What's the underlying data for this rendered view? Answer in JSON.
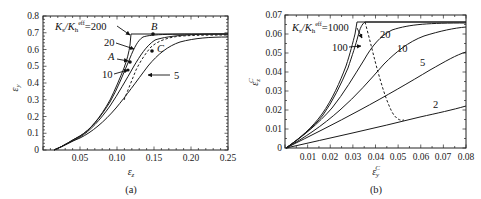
{
  "chart_data": [
    {
      "panel": "(a)",
      "type": "line",
      "title": "",
      "xlabel": "ε_z",
      "ylabel": "ε_y",
      "xlim": [
        0,
        0.25
      ],
      "ylim": [
        0,
        0.8
      ],
      "xticks": [
        "0.05",
        "0.10",
        "0.15",
        "0.20",
        "0.25"
      ],
      "yticks": [
        "0",
        "0.1",
        "0.2",
        "0.3",
        "0.4",
        "0.5",
        "0.6",
        "0.7",
        "0.8"
      ],
      "grid": false,
      "legend": "none (inline annotations)",
      "legend_title": "K_s/K_h^eff",
      "series": [
        {
          "name": "200",
          "x": [
            0.015,
            0.03,
            0.05,
            0.07,
            0.09,
            0.1,
            0.11,
            0.115,
            0.12,
            0.25
          ],
          "y": [
            0,
            0.02,
            0.08,
            0.18,
            0.33,
            0.42,
            0.52,
            0.58,
            0.69,
            0.69
          ]
        },
        {
          "name": "20",
          "x": [
            0.015,
            0.03,
            0.05,
            0.07,
            0.09,
            0.1,
            0.11,
            0.12,
            0.13,
            0.15,
            0.2,
            0.25
          ],
          "y": [
            0,
            0.02,
            0.08,
            0.18,
            0.32,
            0.4,
            0.48,
            0.58,
            0.65,
            0.68,
            0.69,
            0.69
          ]
        },
        {
          "name": "10",
          "x": [
            0.015,
            0.03,
            0.05,
            0.07,
            0.09,
            0.1,
            0.11,
            0.12,
            0.13,
            0.15,
            0.2,
            0.25
          ],
          "y": [
            0,
            0.02,
            0.08,
            0.17,
            0.3,
            0.37,
            0.44,
            0.52,
            0.59,
            0.65,
            0.685,
            0.69
          ]
        },
        {
          "name": "5",
          "x": [
            0.015,
            0.03,
            0.05,
            0.07,
            0.09,
            0.11,
            0.13,
            0.15,
            0.17,
            0.2,
            0.25
          ],
          "y": [
            0,
            0.02,
            0.07,
            0.15,
            0.25,
            0.36,
            0.46,
            0.55,
            0.61,
            0.65,
            0.67
          ]
        },
        {
          "name": "locus (dashed)",
          "x": [
            0.11,
            0.12,
            0.13,
            0.14,
            0.15,
            0.17,
            0.2,
            0.25
          ],
          "y": [
            0.3,
            0.42,
            0.52,
            0.59,
            0.63,
            0.67,
            0.68,
            0.69
          ]
        }
      ],
      "annotations": [
        {
          "text": "K_s/K_h^eff = 200",
          "x": 0.04,
          "y": 0.72
        },
        {
          "text": "20",
          "x": 0.075,
          "y": 0.64
        },
        {
          "text": "10",
          "x": 0.075,
          "y": 0.46
        },
        {
          "text": "5",
          "x": 0.175,
          "y": 0.44
        },
        {
          "text": "A",
          "x": 0.08,
          "y": 0.53,
          "point": [
            0.118,
            0.53
          ]
        },
        {
          "text": "B",
          "x": 0.14,
          "y": 0.72,
          "point": [
            0.138,
            0.69
          ]
        },
        {
          "text": "C",
          "x": 0.16,
          "y": 0.6,
          "point": [
            0.152,
            0.59
          ]
        }
      ]
    },
    {
      "panel": "(b)",
      "type": "line",
      "title": "",
      "xlabel": "ε_y^C",
      "ylabel": "ε_z^C",
      "xlim": [
        0,
        0.08
      ],
      "ylim": [
        0,
        0.07
      ],
      "xticks": [
        "0.01",
        "0.02",
        "0.03",
        "0.04",
        "0.05",
        "0.06",
        "0.07",
        "0.08"
      ],
      "yticks": [
        "0",
        "0.01",
        "0.02",
        "0.03",
        "0.04",
        "0.05",
        "0.06",
        "0.07"
      ],
      "grid": false,
      "legend": "none (inline annotations)",
      "legend_title": "K_s/K_h^eff",
      "series": [
        {
          "name": "1000",
          "x": [
            0,
            0.01,
            0.02,
            0.025,
            0.03,
            0.033,
            0.035,
            0.036,
            0.08
          ],
          "y": [
            0,
            0.008,
            0.02,
            0.03,
            0.042,
            0.052,
            0.06,
            0.067,
            0.067
          ]
        },
        {
          "name": "100",
          "x": [
            0,
            0.01,
            0.02,
            0.025,
            0.03,
            0.034,
            0.036,
            0.038,
            0.08
          ],
          "y": [
            0,
            0.008,
            0.02,
            0.029,
            0.04,
            0.05,
            0.058,
            0.067,
            0.067
          ]
        },
        {
          "name": "20",
          "x": [
            0,
            0.01,
            0.02,
            0.03,
            0.035,
            0.04,
            0.045,
            0.05,
            0.06,
            0.08
          ],
          "y": [
            0,
            0.008,
            0.018,
            0.032,
            0.041,
            0.05,
            0.057,
            0.062,
            0.065,
            0.066
          ]
        },
        {
          "name": "10",
          "x": [
            0,
            0.01,
            0.02,
            0.03,
            0.04,
            0.05,
            0.06,
            0.07,
            0.08
          ],
          "y": [
            0,
            0.007,
            0.016,
            0.027,
            0.039,
            0.049,
            0.057,
            0.061,
            0.063
          ]
        },
        {
          "name": "5",
          "x": [
            0,
            0.01,
            0.02,
            0.03,
            0.04,
            0.05,
            0.06,
            0.07,
            0.08
          ],
          "y": [
            0,
            0.006,
            0.013,
            0.02,
            0.027,
            0.033,
            0.039,
            0.045,
            0.05
          ]
        },
        {
          "name": "2",
          "x": [
            0,
            0.02,
            0.04,
            0.06,
            0.08
          ],
          "y": [
            0,
            0.0045,
            0.0095,
            0.0155,
            0.0225
          ]
        },
        {
          "name": "locus (dashed)",
          "x": [
            0.036,
            0.038,
            0.04,
            0.042,
            0.045,
            0.048,
            0.052
          ],
          "y": [
            0.067,
            0.06,
            0.05,
            0.04,
            0.03,
            0.02,
            0.0155
          ]
        }
      ],
      "annotations": [
        {
          "text": "K_s/K_h^eff = 1000",
          "x": 0.005,
          "y": 0.062
        },
        {
          "text": "100",
          "x": 0.022,
          "y": 0.053
        },
        {
          "text": "20",
          "x": 0.044,
          "y": 0.062
        },
        {
          "text": "10",
          "x": 0.055,
          "y": 0.055
        },
        {
          "text": "5",
          "x": 0.067,
          "y": 0.042
        },
        {
          "text": "2",
          "x": 0.07,
          "y": 0.022
        }
      ]
    }
  ],
  "panels": {
    "a": {
      "caption": "(a)",
      "xlabel_main": "ε",
      "xlabel_sub": "z",
      "ylabel_main": "ε",
      "ylabel_sub": "y",
      "yticks": [
        "0",
        "0.1",
        "0.2",
        "0.3",
        "0.4",
        "0.5",
        "0.6",
        "0.7",
        "0.8"
      ],
      "xticks": [
        "0.05",
        "0.10",
        "0.15",
        "0.20",
        "0.25"
      ],
      "labels": {
        "ratio_prefix": "K",
        "ratio_s": "s",
        "ratio_slash": "/K",
        "ratio_h": "h",
        "ratio_eff": "eff",
        "ratio_value": "=200",
        "l20": "20",
        "l10": "10",
        "l5": "5",
        "A": "A",
        "B": "B",
        "C": "C"
      }
    },
    "b": {
      "caption": "(b)",
      "xlabel_main": "ε",
      "xlabel_sub": "y",
      "xlabel_sup": "C",
      "ylabel_main": "ε",
      "ylabel_sub": "z",
      "ylabel_sup": "C",
      "yticks": [
        "0",
        "0.01",
        "0.02",
        "0.03",
        "0.04",
        "0.05",
        "0.06",
        "0.07"
      ],
      "xticks": [
        "0.01",
        "0.02",
        "0.03",
        "0.04",
        "0.05",
        "0.06",
        "0.07",
        "0.08"
      ],
      "labels": {
        "ratio_prefix": "K",
        "ratio_s": "s",
        "ratio_slash": "/K",
        "ratio_h": "h",
        "ratio_eff": "eff",
        "ratio_value": "=1000",
        "l100": "100",
        "l20": "20",
        "l10": "10",
        "l5": "5",
        "l2": "2"
      }
    }
  }
}
